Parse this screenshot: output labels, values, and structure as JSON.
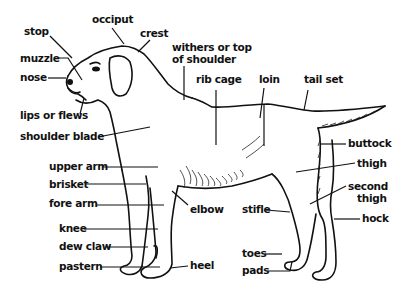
{
  "diagram": {
    "labels": {
      "stop": "stop",
      "occiput": "occiput",
      "crest": "crest",
      "muzzle": "muzzle",
      "nose": "nose",
      "lips": "lips or flews",
      "shoulder_blade": "shoulder blade",
      "withers_1": "withers or top",
      "withers_2": "of shoulder",
      "rib_cage": "rib cage",
      "loin": "loin",
      "tail_set": "tail set",
      "buttock": "buttock",
      "thigh": "thigh",
      "second_thigh_1": "second",
      "second_thigh_2": "thigh",
      "hock": "hock",
      "upper_arm": "upper arm",
      "brisket": "brisket",
      "fore_arm": "fore arm",
      "knee": "knee",
      "dew_claw": "dew claw",
      "pastern": "pastern",
      "elbow": "elbow",
      "stifle": "stifle",
      "heel": "heel",
      "toes": "toes",
      "pads": "pads"
    },
    "colors": {
      "ink": "#111111",
      "background": "#ffffff"
    }
  }
}
